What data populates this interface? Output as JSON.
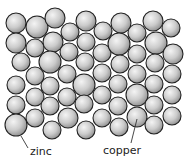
{
  "diagram": {
    "labels": [
      {
        "id": "zinc",
        "text": "zinc",
        "x": 30,
        "y": 146
      },
      {
        "id": "copper",
        "text": "copper",
        "x": 103,
        "y": 145
      }
    ],
    "pointers": [
      {
        "id": "zinc",
        "x1": 21,
        "y1": 136,
        "x2": 28,
        "y2": 148
      },
      {
        "id": "copper",
        "x1": 137,
        "y1": 119,
        "x2": 131,
        "y2": 143
      }
    ],
    "colors": {
      "atom_fill_light": "#f2f2f2",
      "atom_fill_mid": "#c8c8c8",
      "atom_fill_dark": "#8e8e8e",
      "atom_stroke": "#222222",
      "pointer": "#333333"
    },
    "atoms": [
      [
        16,
        23,
        10
      ],
      [
        37,
        27,
        11
      ],
      [
        55,
        18,
        10
      ],
      [
        70,
        32,
        9
      ],
      [
        86,
        21,
        10
      ],
      [
        103,
        31,
        9
      ],
      [
        121,
        23,
        10
      ],
      [
        137,
        33,
        9
      ],
      [
        153,
        21,
        10
      ],
      [
        171,
        28,
        9
      ],
      [
        16,
        43,
        10
      ],
      [
        35,
        48,
        9
      ],
      [
        53,
        42,
        10
      ],
      [
        69,
        52,
        9
      ],
      [
        86,
        42,
        9
      ],
      [
        102,
        53,
        9
      ],
      [
        119,
        44,
        11
      ],
      [
        137,
        54,
        9
      ],
      [
        156,
        43,
        11
      ],
      [
        173,
        54,
        10
      ],
      [
        21,
        62,
        9
      ],
      [
        50,
        62,
        11
      ],
      [
        85,
        62,
        9
      ],
      [
        120,
        64,
        9
      ],
      [
        155,
        63,
        9
      ],
      [
        35,
        76,
        9
      ],
      [
        67,
        74,
        9
      ],
      [
        102,
        73,
        9
      ],
      [
        137,
        74,
        9
      ],
      [
        172,
        74,
        9
      ],
      [
        16,
        85,
        9
      ],
      [
        50,
        86,
        9
      ],
      [
        84,
        85,
        11
      ],
      [
        118,
        84,
        9
      ],
      [
        154,
        84,
        9
      ],
      [
        35,
        97,
        9
      ],
      [
        67,
        97,
        9
      ],
      [
        102,
        95,
        9
      ],
      [
        137,
        95,
        11
      ],
      [
        172,
        95,
        9
      ],
      [
        16,
        105,
        9
      ],
      [
        50,
        106,
        9
      ],
      [
        84,
        104,
        9
      ],
      [
        118,
        106,
        9
      ],
      [
        154,
        105,
        9
      ],
      [
        16,
        125,
        11
      ],
      [
        35,
        118,
        9
      ],
      [
        52,
        130,
        9
      ],
      [
        68,
        118,
        10
      ],
      [
        86,
        130,
        9
      ],
      [
        102,
        118,
        9
      ],
      [
        119,
        127,
        9
      ],
      [
        137,
        117,
        10
      ],
      [
        154,
        125,
        9
      ],
      [
        172,
        116,
        9
      ]
    ]
  }
}
